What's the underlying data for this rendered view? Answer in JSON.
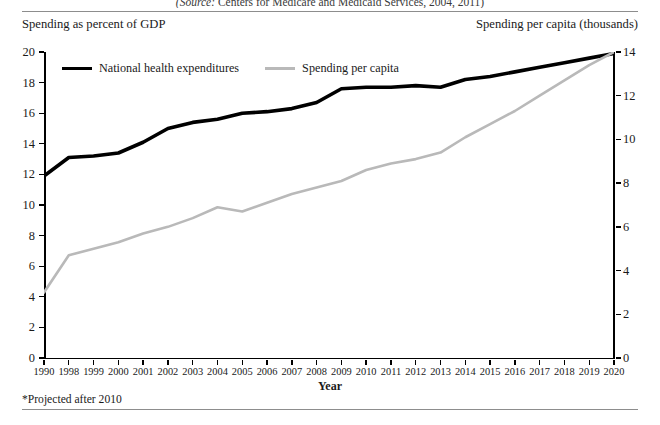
{
  "figure": {
    "source_prefix": "(Source:",
    "source_text": " Centers for Medicare and Medicaid Services, 2004, 2011)",
    "left_axis_caption": "Spending as percent of GDP",
    "right_axis_caption": "Spending per capita (thousands)",
    "footnote": "*Projected after 2010"
  },
  "chart_data": {
    "type": "line",
    "title": "",
    "subtitle": "",
    "xlabel": "Year",
    "ylabel": "Spending as percent of GDP",
    "y2label": "Spending per capita (thousands)",
    "categories": [
      "1990",
      "1998",
      "1999",
      "2000",
      "2001",
      "2002",
      "2003",
      "2004",
      "2005",
      "2006",
      "2007",
      "2008",
      "2009",
      "2010",
      "2011",
      "2012",
      "2013",
      "2014",
      "2015",
      "2016",
      "2017",
      "2018",
      "2019",
      "2020"
    ],
    "ylim": [
      0,
      20
    ],
    "yticks": [
      0,
      2,
      4,
      6,
      8,
      10,
      12,
      14,
      16,
      18,
      20
    ],
    "y2lim": [
      0,
      14
    ],
    "y2ticks": [
      0,
      2,
      4,
      6,
      8,
      10,
      12,
      14
    ],
    "grid": false,
    "legend_position": "top-left",
    "series": [
      {
        "name": "National health expenditures",
        "axis": "left",
        "color": "#000000",
        "width": 3.6,
        "values": [
          11.9,
          13.1,
          13.2,
          13.4,
          14.1,
          15.0,
          15.4,
          15.6,
          16.0,
          16.1,
          16.3,
          16.7,
          17.6,
          17.7,
          17.7,
          17.8,
          17.7,
          18.2,
          18.4,
          18.7,
          19.0,
          19.3,
          19.6,
          19.9
        ]
      },
      {
        "name": "Spending per capita",
        "axis": "right",
        "color": "#b9b9b9",
        "width": 2.6,
        "values": [
          3.0,
          4.7,
          5.0,
          5.3,
          5.7,
          6.0,
          6.4,
          6.9,
          6.7,
          7.1,
          7.5,
          7.8,
          8.1,
          8.6,
          8.9,
          9.1,
          9.4,
          10.1,
          10.7,
          11.3,
          12.0,
          12.7,
          13.4,
          14.0
        ]
      }
    ]
  }
}
